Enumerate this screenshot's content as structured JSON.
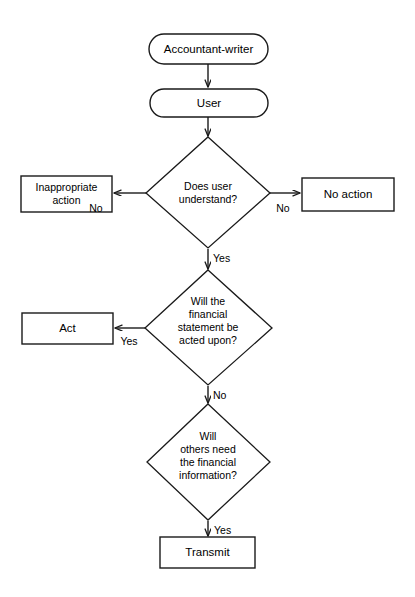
{
  "diagram": {
    "background_color": "#ffffff",
    "line_color": "#1a1a1a",
    "text_color": "#000000"
  },
  "nodes": {
    "start": {
      "label": "Accountant-writer",
      "shape": "rounded-rectangle"
    },
    "user": {
      "label": "User",
      "shape": "rounded-rectangle"
    },
    "decision_understand": {
      "shape": "diamond",
      "line1": "Does user",
      "line2": "understand?"
    },
    "inappropriate_action": {
      "label1": "Inappropriate",
      "label2": "action",
      "shape": "rectangle"
    },
    "no_action": {
      "label": "No action",
      "shape": "rectangle"
    },
    "decision_acted_upon": {
      "shape": "diamond",
      "line1": "Will the",
      "line2": "financial",
      "line3": "statement be",
      "line4": "acted upon?"
    },
    "act": {
      "label": "Act",
      "shape": "rectangle"
    },
    "decision_others_need": {
      "shape": "diamond",
      "line1": "Will",
      "line2": "others need",
      "line3": "the financial",
      "line4": "information?"
    },
    "transmit": {
      "label": "Transmit",
      "shape": "rectangle"
    }
  },
  "edge_labels": {
    "understand_left_no": "No",
    "understand_right_no": "No",
    "understand_down_yes": "Yes",
    "acted_upon_left_yes": "Yes",
    "acted_upon_down_no": "No",
    "others_need_down_yes": "Yes"
  }
}
